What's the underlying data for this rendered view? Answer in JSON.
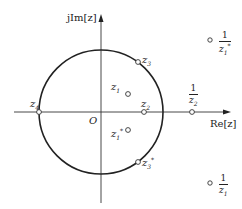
{
  "diagram": {
    "type": "z-plane pole-zero diagram",
    "axes": {
      "imag_label": "jIm[z]",
      "real_label": "Re[z]",
      "origin_label": "O"
    },
    "unit_circle": {
      "center": [
        101,
        112
      ],
      "radius": 62
    },
    "colors": {
      "line": "#222222",
      "background": "#ffffff"
    },
    "points": [
      {
        "id": "z1",
        "label": "z",
        "sub": "1",
        "sup": "",
        "pos": [
          128,
          94
        ]
      },
      {
        "id": "z1conj",
        "label": "z",
        "sub": "1",
        "sup": "*",
        "pos": [
          128,
          130
        ]
      },
      {
        "id": "z2",
        "label": "z",
        "sub": "2",
        "sup": "",
        "pos": [
          144,
          112
        ]
      },
      {
        "id": "z3",
        "label": "z",
        "sub": "3",
        "sup": "",
        "pos": [
          138,
          62
        ]
      },
      {
        "id": "z3conj",
        "label": "z",
        "sub": "3",
        "sup": "*",
        "pos": [
          138,
          162
        ]
      },
      {
        "id": "z4",
        "label": "z",
        "sub": "4",
        "sup": "",
        "pos": [
          39,
          112
        ]
      },
      {
        "id": "inv_z2",
        "num": "1",
        "den": "z",
        "den_sub": "2",
        "den_sup": "",
        "pos": [
          192,
          112
        ]
      },
      {
        "id": "inv_z1conj",
        "num": "1",
        "den": "z",
        "den_sub": "1",
        "den_sup": "*",
        "pos": [
          210,
          40
        ]
      },
      {
        "id": "inv_z1",
        "num": "1",
        "den": "z",
        "den_sub": "1",
        "den_sup": "",
        "pos": [
          210,
          183
        ]
      }
    ]
  }
}
